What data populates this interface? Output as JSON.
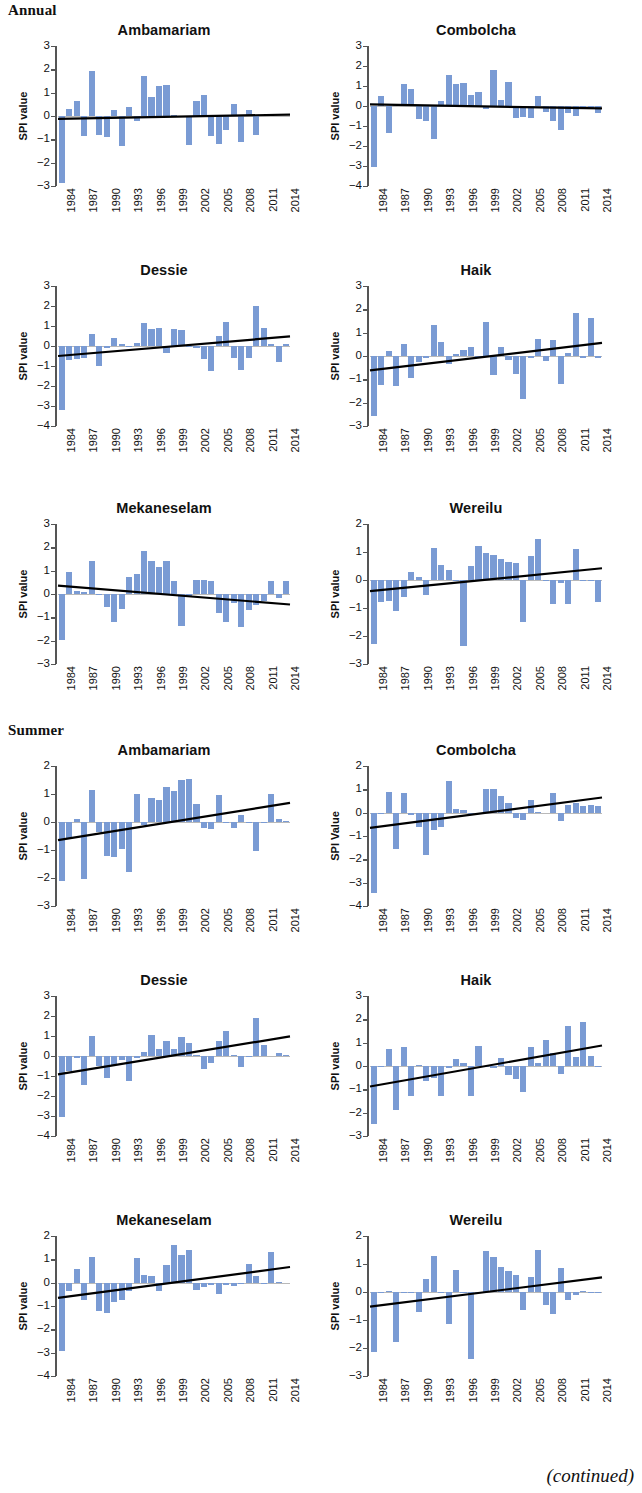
{
  "sections": [
    {
      "label": "Annual"
    },
    {
      "label": "Summer"
    }
  ],
  "footer": {
    "continued": "(continued)"
  },
  "axis": {
    "ylabel_default": "SPI value",
    "xtick_labels": [
      "1984",
      "1987",
      "1990",
      "1993",
      "1996",
      "1999",
      "2002",
      "2005",
      "2008",
      "2011",
      "2014"
    ],
    "years_start": 1984,
    "years_end": 2014
  },
  "style": {
    "bar_color": "#7a9bd4",
    "trend_color": "#000000",
    "zeroline_color": "#b9b9b9",
    "axis_color": "#555555",
    "text_color": "#111111"
  },
  "chart_data": [
    {
      "type": "bar",
      "section": "Annual",
      "title": "Ambamariam",
      "ylabel": "SPI value",
      "xlabel": "",
      "ylim": [
        -3,
        3
      ],
      "yticks": [
        -3,
        -2,
        -1,
        0,
        1,
        2,
        3
      ],
      "x": [
        1984,
        1985,
        1986,
        1987,
        1988,
        1989,
        1990,
        1991,
        1992,
        1993,
        1994,
        1995,
        1996,
        1997,
        1998,
        1999,
        2000,
        2001,
        2002,
        2003,
        2004,
        2005,
        2006,
        2007,
        2008,
        2009,
        2010,
        2011,
        2012,
        2013,
        2014
      ],
      "values": [
        -2.85,
        0.3,
        0.65,
        -0.85,
        1.95,
        -0.8,
        -0.9,
        0.25,
        -1.3,
        0.4,
        -0.2,
        1.7,
        0.8,
        1.3,
        1.35,
        0.05,
        -0.05,
        -1.25,
        0.65,
        0.9,
        -0.85,
        -1.2,
        -0.6,
        0.5,
        -1.1,
        0.25,
        -0.8,
        0.05,
        0.0,
        0.0,
        0.0
      ],
      "trend": {
        "y_start": -0.12,
        "y_end": 0.06
      },
      "grid": false,
      "legend": "none"
    },
    {
      "type": "bar",
      "section": "Annual",
      "title": "Combolcha",
      "ylabel": "SPI value",
      "xlabel": "",
      "ylim": [
        -4,
        3
      ],
      "yticks": [
        -4,
        -3,
        -2,
        -1,
        0,
        1,
        2,
        3
      ],
      "x": [
        1984,
        1985,
        1986,
        1987,
        1988,
        1989,
        1990,
        1991,
        1992,
        1993,
        1994,
        1995,
        1996,
        1997,
        1998,
        1999,
        2000,
        2001,
        2002,
        2003,
        2004,
        2005,
        2006,
        2007,
        2008,
        2009,
        2010,
        2011,
        2012,
        2013,
        2014
      ],
      "values": [
        -3.05,
        0.5,
        -1.35,
        0.1,
        1.1,
        0.85,
        -0.65,
        -0.75,
        -1.65,
        0.25,
        1.55,
        1.1,
        1.15,
        0.55,
        0.7,
        -0.15,
        1.8,
        0.3,
        1.2,
        -0.6,
        -0.55,
        -0.6,
        0.5,
        -0.3,
        -0.75,
        -1.2,
        -0.35,
        -0.5,
        -0.15,
        -0.1,
        -0.35
      ],
      "trend": {
        "y_start": 0.08,
        "y_end": -0.12
      },
      "grid": false,
      "legend": "none"
    },
    {
      "type": "bar",
      "section": "Annual",
      "title": "Dessie",
      "ylabel": "SPI value",
      "xlabel": "",
      "ylim": [
        -4,
        3
      ],
      "yticks": [
        -4,
        -3,
        -2,
        -1,
        0,
        1,
        2,
        3
      ],
      "x": [
        1984,
        1985,
        1986,
        1987,
        1988,
        1989,
        1990,
        1991,
        1992,
        1993,
        1994,
        1995,
        1996,
        1997,
        1998,
        1999,
        2000,
        2001,
        2002,
        2003,
        2004,
        2005,
        2006,
        2007,
        2008,
        2009,
        2010,
        2011,
        2012,
        2013,
        2014
      ],
      "values": [
        -3.2,
        -0.7,
        -0.65,
        -0.6,
        0.6,
        -1.0,
        -0.1,
        0.4,
        0.1,
        -0.05,
        0.15,
        1.15,
        0.85,
        0.9,
        -0.35,
        0.85,
        0.8,
        -0.05,
        -0.1,
        -0.65,
        -1.25,
        0.5,
        1.2,
        -0.6,
        -1.2,
        -0.6,
        2.0,
        0.9,
        0.1,
        -0.8,
        0.1
      ],
      "trend": {
        "y_start": -0.5,
        "y_end": 0.48
      },
      "grid": false,
      "legend": "none"
    },
    {
      "type": "bar",
      "section": "Annual",
      "title": "Haik",
      "ylabel": "SPI value",
      "xlabel": "",
      "ylim": [
        -3,
        3
      ],
      "yticks": [
        -3,
        -2,
        -1,
        0,
        1,
        2,
        3
      ],
      "x": [
        1984,
        1985,
        1986,
        1987,
        1988,
        1989,
        1990,
        1991,
        1992,
        1993,
        1994,
        1995,
        1996,
        1997,
        1998,
        1999,
        2000,
        2001,
        2002,
        2003,
        2004,
        2005,
        2006,
        2007,
        2008,
        2009,
        2010,
        2011,
        2012,
        2013,
        2014
      ],
      "values": [
        -2.55,
        -1.25,
        0.2,
        -1.3,
        0.5,
        -0.95,
        -0.25,
        -0.1,
        1.35,
        0.6,
        -0.35,
        0.1,
        0.25,
        0.4,
        -0.1,
        1.45,
        -0.8,
        0.4,
        -0.15,
        -0.75,
        -1.85,
        -0.1,
        0.75,
        -0.2,
        0.7,
        -1.2,
        0.15,
        1.85,
        -0.1,
        1.65,
        -0.1
      ],
      "trend": {
        "y_start": -0.62,
        "y_end": 0.56
      },
      "grid": false,
      "legend": "none"
    },
    {
      "type": "bar",
      "section": "Annual",
      "title": "Mekaneselam",
      "ylabel": "SPI value",
      "xlabel": "",
      "ylim": [
        -3,
        3
      ],
      "yticks": [
        -3,
        -2,
        -1,
        0,
        1,
        2,
        3
      ],
      "x": [
        1984,
        1985,
        1986,
        1987,
        1988,
        1989,
        1990,
        1991,
        1992,
        1993,
        1994,
        1995,
        1996,
        1997,
        1998,
        1999,
        2000,
        2001,
        2002,
        2003,
        2004,
        2005,
        2006,
        2007,
        2008,
        2009,
        2010,
        2011,
        2012,
        2013,
        2014
      ],
      "values": [
        -1.95,
        0.95,
        0.15,
        0.1,
        1.4,
        -0.05,
        -0.55,
        -1.2,
        -0.65,
        0.75,
        0.85,
        1.85,
        1.4,
        1.15,
        1.4,
        0.55,
        -1.35,
        -0.1,
        0.6,
        0.6,
        0.55,
        -0.8,
        -1.2,
        -0.4,
        -1.4,
        -0.7,
        -0.45,
        -0.3,
        0.55,
        -0.15,
        0.55
      ],
      "trend": {
        "y_start": 0.36,
        "y_end": -0.45
      },
      "grid": false,
      "legend": "none"
    },
    {
      "type": "bar",
      "section": "Annual",
      "title": "Wereilu",
      "ylabel": "SPI value",
      "xlabel": "",
      "ylim": [
        -3,
        2
      ],
      "yticks": [
        -3,
        -2,
        -1,
        0,
        1,
        2
      ],
      "x": [
        1984,
        1985,
        1986,
        1987,
        1988,
        1989,
        1990,
        1991,
        1992,
        1993,
        1994,
        1995,
        1996,
        1997,
        1998,
        1999,
        2000,
        2001,
        2002,
        2003,
        2004,
        2005,
        2006,
        2007,
        2008,
        2009,
        2010,
        2011,
        2012,
        2013,
        2014
      ],
      "values": [
        -2.3,
        -0.8,
        -0.75,
        -1.1,
        -0.6,
        0.3,
        0.1,
        -0.55,
        1.15,
        0.55,
        0.35,
        -0.05,
        -2.35,
        0.5,
        1.2,
        0.95,
        0.9,
        0.75,
        0.65,
        0.6,
        -1.5,
        0.85,
        1.45,
        -0.05,
        -0.85,
        -0.1,
        -0.85,
        1.1,
        -0.05,
        -0.05,
        -0.8
      ],
      "trend": {
        "y_start": -0.4,
        "y_end": 0.42
      },
      "grid": false,
      "legend": "none"
    },
    {
      "type": "bar",
      "section": "Summer",
      "title": "Ambamariam",
      "ylabel": "SPI value",
      "xlabel": "",
      "ylim": [
        -3,
        2
      ],
      "yticks": [
        -3,
        -2,
        -1,
        0,
        1,
        2
      ],
      "x": [
        1984,
        1985,
        1986,
        1987,
        1988,
        1989,
        1990,
        1991,
        1992,
        1993,
        1994,
        1995,
        1996,
        1997,
        1998,
        1999,
        2000,
        2001,
        2002,
        2003,
        2004,
        2005,
        2006,
        2007,
        2008,
        2009,
        2010,
        2011,
        2012,
        2013,
        2014
      ],
      "values": [
        -2.1,
        -0.6,
        0.1,
        -2.05,
        1.15,
        -0.35,
        -1.2,
        -1.25,
        -0.95,
        -1.8,
        1.0,
        -0.1,
        0.85,
        0.8,
        1.25,
        1.1,
        1.5,
        1.55,
        0.65,
        -0.2,
        -0.25,
        0.95,
        -0.05,
        -0.2,
        0.25,
        -0.05,
        -1.05,
        -0.05,
        1.0,
        0.1,
        0.05
      ],
      "trend": {
        "y_start": -0.65,
        "y_end": 0.68
      },
      "grid": false,
      "legend": "none"
    },
    {
      "type": "bar",
      "section": "Summer",
      "title": "Combolcha",
      "ylabel": "SPI Value",
      "xlabel": "",
      "ylim": [
        -4,
        2
      ],
      "yticks": [
        -4,
        -3,
        -2,
        -1,
        0,
        1,
        2
      ],
      "x": [
        1984,
        1985,
        1986,
        1987,
        1988,
        1989,
        1990,
        1991,
        1992,
        1993,
        1994,
        1995,
        1996,
        1997,
        1998,
        1999,
        2000,
        2001,
        2002,
        2003,
        2004,
        2005,
        2006,
        2007,
        2008,
        2009,
        2010,
        2011,
        2012,
        2013,
        2014
      ],
      "values": [
        -3.45,
        -0.05,
        0.9,
        -1.55,
        0.85,
        -0.1,
        -0.6,
        -1.8,
        -0.75,
        -0.6,
        1.35,
        0.15,
        0.1,
        -0.05,
        -0.05,
        1.0,
        1.0,
        0.7,
        0.4,
        -0.25,
        -0.3,
        0.55,
        0.05,
        0.0,
        0.85,
        -0.35,
        0.35,
        0.4,
        0.3,
        0.35,
        0.3
      ],
      "trend": {
        "y_start": -0.65,
        "y_end": 0.65
      },
      "grid": false,
      "legend": "none"
    },
    {
      "type": "bar",
      "section": "Summer",
      "title": "Dessie",
      "ylabel": "SPI value",
      "xlabel": "",
      "ylim": [
        -4,
        3
      ],
      "yticks": [
        -4,
        -3,
        -2,
        -1,
        0,
        1,
        2,
        3
      ],
      "x": [
        1984,
        1985,
        1986,
        1987,
        1988,
        1989,
        1990,
        1991,
        1992,
        1993,
        1994,
        1995,
        1996,
        1997,
        1998,
        1999,
        2000,
        2001,
        2002,
        2003,
        2004,
        2005,
        2006,
        2007,
        2008,
        2009,
        2010,
        2011,
        2012,
        2013,
        2014
      ],
      "values": [
        -3.05,
        -0.75,
        -0.1,
        -1.45,
        1.0,
        -0.5,
        -1.1,
        -0.45,
        -0.2,
        -1.25,
        -0.1,
        0.2,
        1.05,
        0.35,
        0.75,
        0.35,
        0.95,
        0.65,
        0.05,
        -0.65,
        -0.35,
        0.75,
        1.25,
        0.05,
        -0.55,
        -0.05,
        1.9,
        0.55,
        0.0,
        0.15,
        0.05
      ],
      "trend": {
        "y_start": -0.92,
        "y_end": 0.98
      },
      "grid": false,
      "legend": "none"
    },
    {
      "type": "bar",
      "section": "Summer",
      "title": "Haik",
      "ylabel": "SPI value",
      "xlabel": "",
      "ylim": [
        -3,
        3
      ],
      "yticks": [
        -3,
        -2,
        -1,
        0,
        1,
        2,
        3
      ],
      "x": [
        1984,
        1985,
        1986,
        1987,
        1988,
        1989,
        1990,
        1991,
        1992,
        1993,
        1994,
        1995,
        1996,
        1997,
        1998,
        1999,
        2000,
        2001,
        2002,
        2003,
        2004,
        2005,
        2006,
        2007,
        2008,
        2009,
        2010,
        2011,
        2012,
        2013,
        2014
      ],
      "values": [
        -2.5,
        -0.05,
        0.75,
        -1.9,
        0.8,
        -1.3,
        0.05,
        -0.65,
        -0.5,
        -1.3,
        -0.1,
        0.3,
        0.15,
        -1.3,
        0.85,
        -0.05,
        -0.1,
        0.35,
        -0.4,
        -0.55,
        -1.1,
        0.8,
        0.15,
        1.1,
        0.55,
        -0.35,
        1.7,
        0.4,
        1.9,
        0.45,
        -0.05
      ],
      "trend": {
        "y_start": -0.88,
        "y_end": 0.88
      },
      "grid": false,
      "legend": "none"
    },
    {
      "type": "bar",
      "section": "Summer",
      "title": "Mekaneselam",
      "ylabel": "SPI value",
      "xlabel": "",
      "ylim": [
        -4,
        2
      ],
      "yticks": [
        -4,
        -3,
        -2,
        -1,
        0,
        1,
        2
      ],
      "x": [
        1984,
        1985,
        1986,
        1987,
        1988,
        1989,
        1990,
        1991,
        1992,
        1993,
        1994,
        1995,
        1996,
        1997,
        1998,
        1999,
        2000,
        2001,
        2002,
        2003,
        2004,
        2005,
        2006,
        2007,
        2008,
        2009,
        2010,
        2011,
        2012,
        2013,
        2014
      ],
      "values": [
        -2.95,
        -0.35,
        0.6,
        -0.75,
        1.1,
        -1.2,
        -1.3,
        -0.85,
        -0.75,
        -0.35,
        1.05,
        0.35,
        0.3,
        -0.35,
        0.75,
        1.6,
        1.2,
        1.4,
        -0.3,
        -0.2,
        -0.1,
        -0.5,
        -0.1,
        -0.15,
        -0.05,
        0.8,
        0.3,
        -0.05,
        1.3,
        0.05,
        0.0
      ],
      "trend": {
        "y_start": -0.65,
        "y_end": 0.67
      },
      "grid": false,
      "legend": "none"
    },
    {
      "type": "bar",
      "section": "Summer",
      "title": "Wereilu",
      "ylabel": "SPI value",
      "xlabel": "",
      "ylim": [
        -3,
        2
      ],
      "yticks": [
        -3,
        -2,
        -1,
        0,
        1,
        2
      ],
      "x": [
        1984,
        1985,
        1986,
        1987,
        1988,
        1989,
        1990,
        1991,
        1992,
        1993,
        1994,
        1995,
        1996,
        1997,
        1998,
        1999,
        2000,
        2001,
        2002,
        2003,
        2004,
        2005,
        2006,
        2007,
        2008,
        2009,
        2010,
        2011,
        2012,
        2013,
        2014
      ],
      "values": [
        -2.15,
        -0.05,
        0.05,
        -1.8,
        -0.05,
        -0.05,
        -0.7,
        0.45,
        1.3,
        -0.05,
        -1.15,
        0.8,
        -0.05,
        -2.4,
        -0.05,
        1.45,
        1.25,
        0.9,
        0.75,
        0.6,
        -0.65,
        0.55,
        1.5,
        -0.45,
        -0.8,
        0.85,
        -0.3,
        -0.1,
        0.05,
        -0.05,
        -0.05
      ],
      "trend": {
        "y_start": -0.52,
        "y_end": 0.52
      },
      "grid": false,
      "legend": "none"
    }
  ]
}
